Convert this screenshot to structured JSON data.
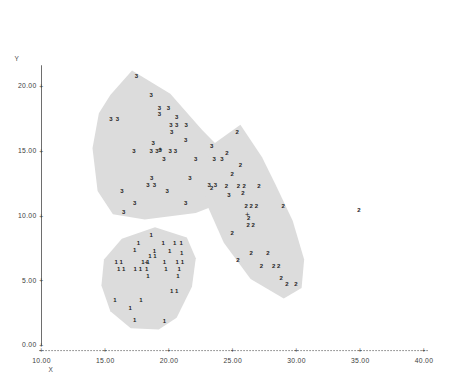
{
  "chart_data": {
    "type": "scatter",
    "title": "",
    "xlabel": "X",
    "ylabel": "Y",
    "xlim": [
      10.0,
      40.0
    ],
    "ylim": [
      0.0,
      22.0
    ],
    "x_ticks": [
      {
        "value": 10.0,
        "label": "10.00"
      },
      {
        "value": 15.0,
        "label": "15.00"
      },
      {
        "value": 20.0,
        "label": "20.00"
      },
      {
        "value": 25.0,
        "label": "25.00"
      },
      {
        "value": 30.0,
        "label": "30.00"
      },
      {
        "value": 35.0,
        "label": "35.00"
      },
      {
        "value": 40.0,
        "label": "40.00"
      }
    ],
    "y_ticks": [
      {
        "value": 0.0,
        "label": "0.00"
      },
      {
        "value": 5.0,
        "label": "5.00"
      },
      {
        "value": 10.0,
        "label": "10.00"
      },
      {
        "value": 15.0,
        "label": "15.00"
      },
      {
        "value": 20.0,
        "label": "20.00"
      }
    ],
    "grid": false,
    "legend": "none",
    "axis_style": "dotted-x-axis-with-plus-ticks",
    "marker_style": "cluster-number-label",
    "centroid_marker": "+",
    "hull_fill_color": "#dcdcdc",
    "series": [
      {
        "name": "3",
        "label": "3",
        "centroid": {
          "x": 19.3,
          "y": 15.1
        },
        "points": [
          {
            "x": 17.45,
            "y": 20.75
          },
          {
            "x": 18.6,
            "y": 19.35
          },
          {
            "x": 19.25,
            "y": 18.3
          },
          {
            "x": 19.95,
            "y": 18.3
          },
          {
            "x": 19.25,
            "y": 17.85
          },
          {
            "x": 20.6,
            "y": 17.6
          },
          {
            "x": 15.45,
            "y": 17.45
          },
          {
            "x": 15.95,
            "y": 17.45
          },
          {
            "x": 20.15,
            "y": 17.0
          },
          {
            "x": 20.6,
            "y": 17.0
          },
          {
            "x": 21.35,
            "y": 17.0
          },
          {
            "x": 20.2,
            "y": 16.45
          },
          {
            "x": 21.3,
            "y": 15.85
          },
          {
            "x": 23.35,
            "y": 15.35
          },
          {
            "x": 18.75,
            "y": 15.6
          },
          {
            "x": 19.3,
            "y": 15.1
          },
          {
            "x": 17.25,
            "y": 14.95
          },
          {
            "x": 18.6,
            "y": 14.95
          },
          {
            "x": 19.05,
            "y": 14.95
          },
          {
            "x": 20.1,
            "y": 14.95
          },
          {
            "x": 20.5,
            "y": 14.95
          },
          {
            "x": 19.6,
            "y": 14.4
          },
          {
            "x": 22.1,
            "y": 14.4
          },
          {
            "x": 23.55,
            "y": 14.4
          },
          {
            "x": 24.15,
            "y": 14.4
          },
          {
            "x": 18.65,
            "y": 12.9
          },
          {
            "x": 21.65,
            "y": 12.9
          },
          {
            "x": 18.35,
            "y": 12.4
          },
          {
            "x": 18.85,
            "y": 12.4
          },
          {
            "x": 23.15,
            "y": 12.4
          },
          {
            "x": 23.65,
            "y": 12.4
          },
          {
            "x": 16.3,
            "y": 11.9
          },
          {
            "x": 19.85,
            "y": 11.9
          },
          {
            "x": 24.7,
            "y": 11.6
          },
          {
            "x": 17.3,
            "y": 11.0
          },
          {
            "x": 21.3,
            "y": 11.0
          },
          {
            "x": 16.45,
            "y": 10.25
          }
        ]
      },
      {
        "name": "2",
        "label": "2",
        "centroid": {
          "x": 26.15,
          "y": 10.1
        },
        "points": [
          {
            "x": 25.35,
            "y": 16.45
          },
          {
            "x": 24.55,
            "y": 14.85
          },
          {
            "x": 25.6,
            "y": 13.9
          },
          {
            "x": 24.95,
            "y": 13.2
          },
          {
            "x": 24.5,
            "y": 12.3
          },
          {
            "x": 25.45,
            "y": 12.3
          },
          {
            "x": 25.9,
            "y": 12.3
          },
          {
            "x": 27.05,
            "y": 12.3
          },
          {
            "x": 23.35,
            "y": 12.15
          },
          {
            "x": 25.8,
            "y": 11.75
          },
          {
            "x": 26.05,
            "y": 10.75
          },
          {
            "x": 26.45,
            "y": 10.75
          },
          {
            "x": 26.85,
            "y": 10.75
          },
          {
            "x": 28.95,
            "y": 10.75
          },
          {
            "x": 26.25,
            "y": 9.85
          },
          {
            "x": 26.2,
            "y": 9.3
          },
          {
            "x": 26.6,
            "y": 9.3
          },
          {
            "x": 24.95,
            "y": 8.65
          },
          {
            "x": 26.45,
            "y": 7.1
          },
          {
            "x": 27.75,
            "y": 7.1
          },
          {
            "x": 25.4,
            "y": 6.55
          },
          {
            "x": 27.25,
            "y": 6.1
          },
          {
            "x": 28.2,
            "y": 6.1
          },
          {
            "x": 28.6,
            "y": 6.1
          },
          {
            "x": 28.8,
            "y": 5.15
          },
          {
            "x": 29.25,
            "y": 4.75
          },
          {
            "x": 29.95,
            "y": 4.75
          },
          {
            "x": 34.9,
            "y": 10.4
          }
        ]
      },
      {
        "name": "1",
        "label": "1",
        "centroid": {
          "x": 18.25,
          "y": 6.35
        },
        "points": [
          {
            "x": 18.6,
            "y": 8.5
          },
          {
            "x": 17.6,
            "y": 7.85
          },
          {
            "x": 19.55,
            "y": 7.85
          },
          {
            "x": 20.45,
            "y": 7.85
          },
          {
            "x": 20.95,
            "y": 7.85
          },
          {
            "x": 17.3,
            "y": 7.35
          },
          {
            "x": 18.85,
            "y": 7.3
          },
          {
            "x": 20.05,
            "y": 7.25
          },
          {
            "x": 21.0,
            "y": 7.15
          },
          {
            "x": 18.5,
            "y": 6.85
          },
          {
            "x": 18.9,
            "y": 6.85
          },
          {
            "x": 15.85,
            "y": 6.4
          },
          {
            "x": 16.25,
            "y": 6.4
          },
          {
            "x": 17.95,
            "y": 6.4
          },
          {
            "x": 18.35,
            "y": 6.4
          },
          {
            "x": 19.65,
            "y": 6.4
          },
          {
            "x": 20.65,
            "y": 6.4
          },
          {
            "x": 21.05,
            "y": 6.4
          },
          {
            "x": 16.05,
            "y": 5.85
          },
          {
            "x": 16.45,
            "y": 5.85
          },
          {
            "x": 17.35,
            "y": 5.85
          },
          {
            "x": 17.75,
            "y": 5.85
          },
          {
            "x": 18.25,
            "y": 5.85
          },
          {
            "x": 19.75,
            "y": 5.85
          },
          {
            "x": 20.8,
            "y": 5.85
          },
          {
            "x": 18.35,
            "y": 5.35
          },
          {
            "x": 20.7,
            "y": 5.3
          },
          {
            "x": 20.2,
            "y": 4.2
          },
          {
            "x": 20.6,
            "y": 4.2
          },
          {
            "x": 15.75,
            "y": 3.5
          },
          {
            "x": 17.8,
            "y": 3.5
          },
          {
            "x": 16.95,
            "y": 2.9
          },
          {
            "x": 17.3,
            "y": 1.95
          },
          {
            "x": 19.65,
            "y": 1.85
          }
        ]
      }
    ],
    "hulls": [
      {
        "cluster": "3",
        "vertices": [
          {
            "x": 17.1,
            "y": 21.2
          },
          {
            "x": 20.1,
            "y": 19.4
          },
          {
            "x": 22.6,
            "y": 16.6
          },
          {
            "x": 24.2,
            "y": 15.0
          },
          {
            "x": 25.1,
            "y": 13.0
          },
          {
            "x": 24.7,
            "y": 11.2
          },
          {
            "x": 22.1,
            "y": 10.2
          },
          {
            "x": 18.1,
            "y": 9.7
          },
          {
            "x": 15.6,
            "y": 10.1
          },
          {
            "x": 14.4,
            "y": 11.9
          },
          {
            "x": 14.0,
            "y": 15.2
          },
          {
            "x": 14.5,
            "y": 17.9
          },
          {
            "x": 15.4,
            "y": 19.3
          }
        ]
      },
      {
        "cluster": "2",
        "vertices": [
          {
            "x": 25.6,
            "y": 17.0
          },
          {
            "x": 27.3,
            "y": 14.5
          },
          {
            "x": 28.4,
            "y": 12.3
          },
          {
            "x": 29.7,
            "y": 9.6
          },
          {
            "x": 30.6,
            "y": 6.6
          },
          {
            "x": 30.4,
            "y": 4.4
          },
          {
            "x": 29.0,
            "y": 3.6
          },
          {
            "x": 26.4,
            "y": 5.1
          },
          {
            "x": 24.3,
            "y": 7.9
          },
          {
            "x": 22.9,
            "y": 11.0
          },
          {
            "x": 22.6,
            "y": 13.6
          },
          {
            "x": 23.6,
            "y": 15.6
          }
        ]
      },
      {
        "cluster": "1",
        "vertices": [
          {
            "x": 18.9,
            "y": 9.1
          },
          {
            "x": 21.4,
            "y": 8.3
          },
          {
            "x": 22.1,
            "y": 6.7
          },
          {
            "x": 21.8,
            "y": 4.5
          },
          {
            "x": 20.6,
            "y": 2.1
          },
          {
            "x": 19.2,
            "y": 1.2
          },
          {
            "x": 17.0,
            "y": 1.3
          },
          {
            "x": 15.4,
            "y": 2.6
          },
          {
            "x": 14.7,
            "y": 4.6
          },
          {
            "x": 14.9,
            "y": 6.6
          },
          {
            "x": 16.3,
            "y": 8.2
          }
        ]
      }
    ]
  }
}
